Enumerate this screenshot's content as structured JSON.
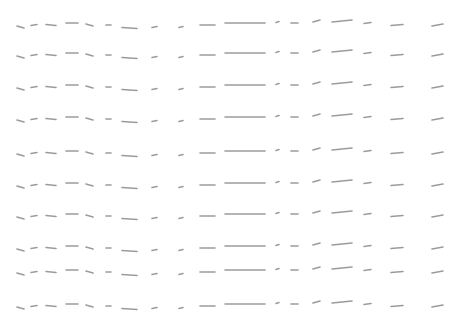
{
  "pattern": {
    "stroke_color": "#8a8a8a",
    "background": "#ffffff",
    "row_y": [
      25,
      55,
      87,
      119,
      153,
      185,
      216,
      248,
      272,
      306
    ],
    "marks": [
      {
        "x": 17,
        "dy": 2,
        "w": 7,
        "tilt": -2
      },
      {
        "x": 31,
        "dy": 0,
        "w": 6,
        "tilt": 1
      },
      {
        "x": 46,
        "dy": 0,
        "w": 10,
        "tilt": -1
      },
      {
        "x": 66,
        "dy": -2,
        "w": 12,
        "tilt": 0
      },
      {
        "x": 86,
        "dy": 0,
        "w": 7,
        "tilt": -2
      },
      {
        "x": 106,
        "dy": 0,
        "w": 5,
        "tilt": 0
      },
      {
        "x": 122,
        "dy": 3,
        "w": 15,
        "tilt": -1
      },
      {
        "x": 152,
        "dy": 2,
        "w": 5,
        "tilt": 1
      },
      {
        "x": 179,
        "dy": 2,
        "w": 4,
        "tilt": 1
      },
      {
        "x": 200,
        "dy": 0,
        "w": 15,
        "tilt": 0
      },
      {
        "x": 225,
        "dy": -2,
        "w": 40,
        "tilt": 0
      },
      {
        "x": 276,
        "dy": -3,
        "w": 3,
        "tilt": 1
      },
      {
        "x": 291,
        "dy": -2,
        "w": 7,
        "tilt": 0
      },
      {
        "x": 313,
        "dy": -4,
        "w": 7,
        "tilt": 2
      },
      {
        "x": 332,
        "dy": -4,
        "w": 20,
        "tilt": 2
      },
      {
        "x": 364,
        "dy": -2,
        "w": 7,
        "tilt": 1
      },
      {
        "x": 391,
        "dy": 0,
        "w": 12,
        "tilt": 1
      },
      {
        "x": 432,
        "dy": 0,
        "w": 11,
        "tilt": 2
      }
    ]
  }
}
